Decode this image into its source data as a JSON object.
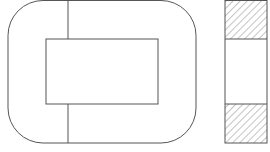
{
  "diagram": {
    "colors": {
      "stroke": "#555555",
      "hatch": "#9a9a9a",
      "background": "#ffffff"
    },
    "front_view": {
      "outer": {
        "x": 8,
        "y": 0.5,
        "w": 188,
        "h": 142.5,
        "rx": 35
      },
      "inner_window": {
        "x": 46,
        "y": 39,
        "w": 112,
        "h": 65
      },
      "split_line_x": 68
    },
    "side_view": {
      "x": 225,
      "y": 0.5,
      "w": 42,
      "h": 142.5,
      "divider_top_y": 39,
      "divider_bottom_y": 104,
      "hatched_sections": [
        "top",
        "bottom"
      ]
    }
  }
}
